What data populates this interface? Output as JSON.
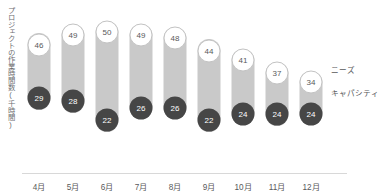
{
  "axis": {
    "y_title": "プロジェクトの作業時間数(千時間)"
  },
  "legend": {
    "needs_label": "ニーズ",
    "capacity_label": "キャパシティ"
  },
  "chart_data": {
    "type": "bar",
    "subtype": "dumbbell-range",
    "title": "",
    "subtitle": "",
    "xlabel": "",
    "ylabel": "プロジェクトの作業時間数(千時間)",
    "ylim": [
      0,
      56
    ],
    "grid": false,
    "legend_position": "right",
    "categories": [
      "4月",
      "5月",
      "6月",
      "7月",
      "8月",
      "9月",
      "10月",
      "11月",
      "12月"
    ],
    "series": [
      {
        "name": "ニーズ",
        "color": "#ffffff",
        "values": [
          46,
          49,
          50,
          49,
          48,
          44,
          41,
          37,
          34
        ]
      },
      {
        "name": "キャパシティ",
        "color": "#464646",
        "values": [
          29,
          28,
          22,
          26,
          26,
          22,
          24,
          24,
          24
        ]
      }
    ],
    "bar_color": "#c9c9c9"
  }
}
